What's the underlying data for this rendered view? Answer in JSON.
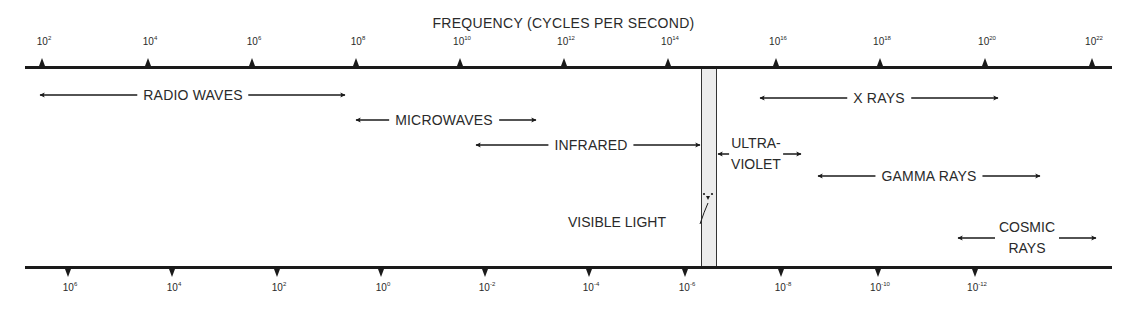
{
  "diagram": {
    "top_axis": {
      "title": "FREQUENCY (CYCLES PER SECOND)",
      "ticks": [
        {
          "base": "10",
          "exp": "2"
        },
        {
          "base": "10",
          "exp": "4"
        },
        {
          "base": "10",
          "exp": "6"
        },
        {
          "base": "10",
          "exp": "8"
        },
        {
          "base": "10",
          "exp": "10"
        },
        {
          "base": "10",
          "exp": "12"
        },
        {
          "base": "10",
          "exp": "14"
        },
        {
          "base": "10",
          "exp": "16"
        },
        {
          "base": "10",
          "exp": "18"
        },
        {
          "base": "10",
          "exp": "20"
        },
        {
          "base": "10",
          "exp": "22"
        }
      ]
    },
    "bottom_axis": {
      "ticks": [
        {
          "base": "10",
          "exp": "6"
        },
        {
          "base": "10",
          "exp": "4"
        },
        {
          "base": "10",
          "exp": "2"
        },
        {
          "base": "10",
          "exp": "0"
        },
        {
          "base": "10",
          "exp": "-2"
        },
        {
          "base": "10",
          "exp": "-4"
        },
        {
          "base": "10",
          "exp": "-6"
        },
        {
          "base": "10",
          "exp": "-8"
        },
        {
          "base": "10",
          "exp": "-10"
        },
        {
          "base": "10",
          "exp": "-12"
        }
      ]
    },
    "bands": {
      "radio": "RADIO WAVES",
      "microwaves": "MICROWAVES",
      "infrared": "INFRARED",
      "ultraviolet_line1": "ULTRA-",
      "ultraviolet_line2": "VIOLET",
      "xrays": "X RAYS",
      "gamma": "GAMMA RAYS",
      "cosmic_line1": "COSMIC",
      "cosmic_line2": "RAYS",
      "visible": "VISIBLE LIGHT"
    },
    "colors": {
      "line": "#1a1a1a",
      "text": "#2a2a2a",
      "visible_band_fill": "#ececec"
    }
  }
}
